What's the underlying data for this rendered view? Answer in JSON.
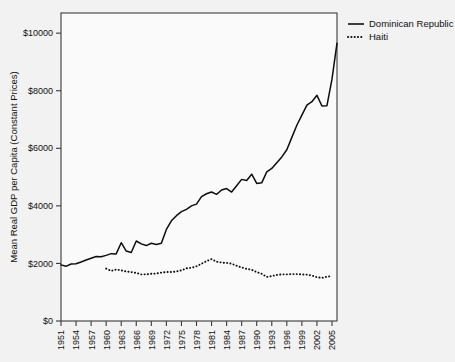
{
  "chart_data": {
    "type": "line",
    "title": "",
    "subtitle": "",
    "xlabel": "",
    "ylabel": "Mean Real GDP per Capita (Constant Prices)",
    "xlim": [
      1951,
      2006
    ],
    "ylim": [
      0,
      10700
    ],
    "grid": false,
    "legend_position": "top-right",
    "y_ticks": [
      0,
      2000,
      4000,
      6000,
      8000,
      10000
    ],
    "y_ticklabels": [
      "$0",
      "$2000",
      "$4000",
      "$6000",
      "$8000",
      "$10000"
    ],
    "x_ticks": [
      1951,
      1954,
      1957,
      1960,
      1963,
      1966,
      1969,
      1972,
      1975,
      1978,
      1981,
      1984,
      1987,
      1990,
      1993,
      1996,
      1999,
      2002,
      2005
    ],
    "x_ticklabels": [
      "1951",
      "1954",
      "1957",
      "1960",
      "1963",
      "1966",
      "1969",
      "1972",
      "1975",
      "1978",
      "1981",
      "1984",
      "1987",
      "1990",
      "1993",
      "1996",
      "1999",
      "2002",
      "2005"
    ],
    "series": [
      {
        "name": "Dominican Republic",
        "style": "solid",
        "color": "#0d0d0d",
        "x": [
          1951,
          1952,
          1953,
          1954,
          1955,
          1956,
          1957,
          1958,
          1959,
          1960,
          1961,
          1962,
          1963,
          1964,
          1965,
          1966,
          1967,
          1968,
          1969,
          1970,
          1971,
          1972,
          1973,
          1974,
          1975,
          1976,
          1977,
          1978,
          1979,
          1980,
          1981,
          1982,
          1983,
          1984,
          1985,
          1986,
          1987,
          1988,
          1989,
          1990,
          1991,
          1992,
          1993,
          1994,
          1995,
          1996,
          1997,
          1998,
          1999,
          2000,
          2001,
          2002,
          2003,
          2004,
          2005,
          2006
        ],
        "values": [
          1950,
          1900,
          1980,
          1990,
          2050,
          2120,
          2180,
          2240,
          2230,
          2280,
          2340,
          2330,
          2720,
          2430,
          2380,
          2780,
          2680,
          2620,
          2700,
          2660,
          2700,
          3180,
          3480,
          3660,
          3800,
          3880,
          4000,
          4060,
          4320,
          4420,
          4480,
          4400,
          4550,
          4600,
          4480,
          4700,
          4920,
          4880,
          5100,
          4780,
          4800,
          5180,
          5300,
          5500,
          5700,
          5950,
          6380,
          6800,
          7150,
          7500,
          7620,
          7840,
          7470,
          7480,
          8400,
          9650
        ]
      },
      {
        "name": "Haiti",
        "style": "dotted",
        "color": "#0d0d0d",
        "x": [
          1960,
          1961,
          1962,
          1963,
          1964,
          1965,
          1966,
          1967,
          1968,
          1969,
          1970,
          1971,
          1972,
          1973,
          1974,
          1975,
          1976,
          1977,
          1978,
          1979,
          1980,
          1981,
          1982,
          1983,
          1984,
          1985,
          1986,
          1987,
          1988,
          1989,
          1990,
          1991,
          1992,
          1993,
          1994,
          1995,
          1996,
          1997,
          1998,
          1999,
          2000,
          2001,
          2002,
          2003,
          2004,
          2005
        ],
        "values": [
          1820,
          1740,
          1790,
          1760,
          1720,
          1700,
          1670,
          1620,
          1620,
          1640,
          1650,
          1680,
          1700,
          1700,
          1720,
          1760,
          1830,
          1850,
          1900,
          1990,
          2080,
          2150,
          2060,
          2030,
          2020,
          1990,
          1920,
          1860,
          1810,
          1780,
          1700,
          1640,
          1530,
          1560,
          1600,
          1620,
          1620,
          1630,
          1630,
          1620,
          1610,
          1580,
          1520,
          1500,
          1540,
          1560
        ]
      }
    ]
  },
  "legend": {
    "items": [
      {
        "label": "Dominican Republic",
        "style": "solid"
      },
      {
        "label": "Haiti",
        "style": "dotted"
      }
    ]
  }
}
